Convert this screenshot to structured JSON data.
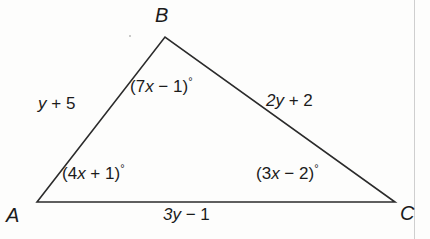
{
  "figure": {
    "background_color": "#fdfdfc",
    "stroke_color": "#2b2b2b",
    "text_color": "#1b1b1b",
    "page_edge_color": "#cfcfcf"
  },
  "vertices": {
    "a": {
      "label": "A",
      "x": 37,
      "y": 202
    },
    "b": {
      "label": "B",
      "x": 165,
      "y": 37
    },
    "c": {
      "label": "C",
      "x": 395,
      "y": 202
    }
  },
  "sides": {
    "ab": {
      "expr_prefix": "y",
      "expr_full": "y + 5",
      "op": " + ",
      "constant": "5"
    },
    "bc": {
      "expr_prefix": "2y",
      "expr_full": "2y + 2",
      "op": " + ",
      "constant": "2"
    },
    "ac": {
      "expr_prefix": "3y",
      "expr_full": "3y − 1",
      "op": " − ",
      "constant": "1"
    }
  },
  "angles": {
    "a": {
      "open": "(4",
      "var": "x",
      "rest": " + 1)",
      "degree": "°",
      "expr_full": "(4x + 1)°"
    },
    "b": {
      "open": "(7",
      "var": "x",
      "rest": " − 1)",
      "degree": "°",
      "expr_full": "(7x − 1)°"
    },
    "c": {
      "open": "(3",
      "var": "x",
      "rest": " − 2)",
      "degree": "°",
      "expr_full": "(3x − 2)°"
    }
  },
  "chart_data": {
    "type": "diagram",
    "shape": "triangle",
    "points": [
      {
        "name": "A",
        "x": 37,
        "y": 202
      },
      {
        "name": "B",
        "x": 165,
        "y": 37
      },
      {
        "name": "C",
        "x": 395,
        "y": 202
      }
    ],
    "edges": [
      {
        "from": "A",
        "to": "B",
        "label": "y + 5"
      },
      {
        "from": "B",
        "to": "C",
        "label": "2y + 2"
      },
      {
        "from": "A",
        "to": "C",
        "label": "3y − 1"
      }
    ],
    "interior_angles": [
      {
        "vertex": "A",
        "label": "(4x + 1)°"
      },
      {
        "vertex": "B",
        "label": "(7x − 1)°"
      },
      {
        "vertex": "C",
        "label": "(3x − 2)°"
      }
    ]
  }
}
